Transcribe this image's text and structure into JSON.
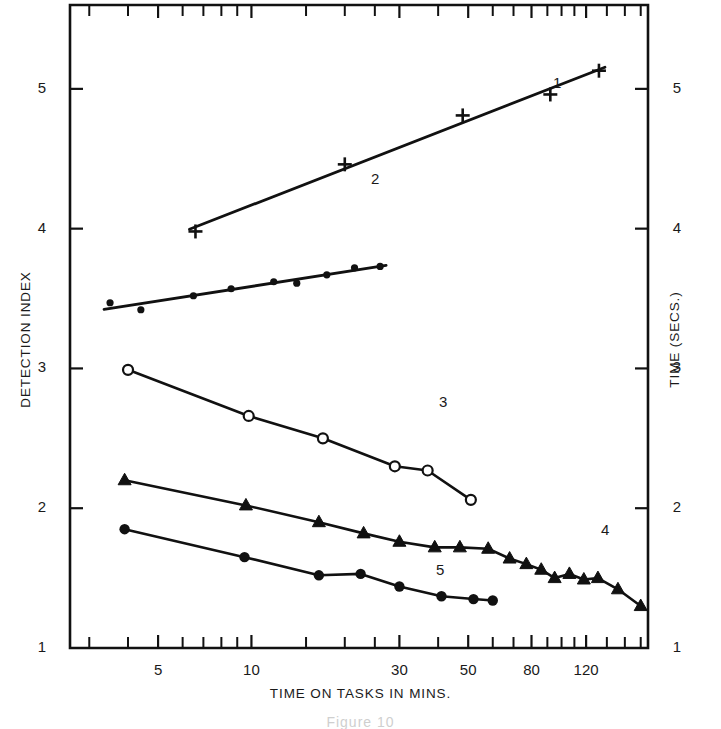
{
  "figure": {
    "caption": "Figure 10",
    "background": "#ffffff",
    "ink_color": "#111111"
  },
  "axes": {
    "x": {
      "title": "TIME ON TASKS IN MINS.",
      "scale": "log",
      "range": [
        2.6,
        190
      ],
      "labeled_ticks": [
        "5",
        "10",
        "30",
        "50",
        "80",
        "120"
      ],
      "labeled_tick_values": [
        5,
        10,
        30,
        50,
        80,
        120
      ],
      "minor_tick_values": [
        3,
        4,
        6,
        7,
        8,
        9,
        15,
        20,
        25,
        40,
        60,
        70,
        90,
        100,
        110,
        140,
        160,
        180
      ]
    },
    "y_left": {
      "title": "DETECTION INDEX",
      "scale": "linear",
      "range": [
        1,
        5.6
      ],
      "labeled_ticks": [
        "1",
        "2",
        "3",
        "4",
        "5"
      ],
      "labeled_tick_values": [
        1,
        2,
        3,
        4,
        5
      ]
    },
    "y_right": {
      "title": "TIME (SECS.)",
      "scale": "linear",
      "range": [
        1,
        5.6
      ],
      "labeled_ticks": [
        "1",
        "2",
        "3",
        "4",
        "5"
      ],
      "labeled_tick_values": [
        1,
        2,
        3,
        4,
        5
      ]
    }
  },
  "chart_data": {
    "type": "line",
    "title": "",
    "subtitle": "",
    "xlabel": "TIME ON TASKS IN MINS.",
    "ylabel": "DETECTION INDEX",
    "y2label": "TIME (SECS.)",
    "xscale": "log",
    "xlim": [
      2.6,
      190
    ],
    "ylim": [
      1,
      5.6
    ],
    "grid": false,
    "legend": "inline-end-labels",
    "series": [
      {
        "name": "1",
        "label": "1",
        "marker": "plus",
        "fit": "straight-line",
        "points": [
          {
            "x": 6.6,
            "y": 3.98
          },
          {
            "x": 20.0,
            "y": 4.46
          },
          {
            "x": 48.0,
            "y": 4.81
          },
          {
            "x": 92.0,
            "y": 4.96
          },
          {
            "x": 132.0,
            "y": 5.13
          }
        ]
      },
      {
        "name": "2",
        "label": "2",
        "marker": "dot-small",
        "fit": "straight-line",
        "points": [
          {
            "x": 3.5,
            "y": 3.47
          },
          {
            "x": 4.4,
            "y": 3.42
          },
          {
            "x": 6.5,
            "y": 3.52
          },
          {
            "x": 8.6,
            "y": 3.57
          },
          {
            "x": 11.8,
            "y": 3.62
          },
          {
            "x": 14.0,
            "y": 3.61
          },
          {
            "x": 17.5,
            "y": 3.67
          },
          {
            "x": 21.5,
            "y": 3.72
          },
          {
            "x": 26.0,
            "y": 3.73
          }
        ]
      },
      {
        "name": "3",
        "label": "3",
        "marker": "open-circle",
        "fit": "connected",
        "points": [
          {
            "x": 4.0,
            "y": 2.99
          },
          {
            "x": 9.8,
            "y": 2.66
          },
          {
            "x": 17.0,
            "y": 2.5
          },
          {
            "x": 29.0,
            "y": 2.3
          },
          {
            "x": 37.0,
            "y": 2.27
          },
          {
            "x": 51.0,
            "y": 2.06
          }
        ]
      },
      {
        "name": "4",
        "label": "4",
        "marker": "triangle",
        "fit": "connected",
        "points": [
          {
            "x": 3.9,
            "y": 2.2
          },
          {
            "x": 9.6,
            "y": 2.02
          },
          {
            "x": 16.5,
            "y": 1.9
          },
          {
            "x": 23.0,
            "y": 1.82
          },
          {
            "x": 30.0,
            "y": 1.76
          },
          {
            "x": 39.0,
            "y": 1.72
          },
          {
            "x": 47.0,
            "y": 1.72
          },
          {
            "x": 58.0,
            "y": 1.71
          },
          {
            "x": 68.0,
            "y": 1.64
          },
          {
            "x": 77.0,
            "y": 1.6
          },
          {
            "x": 86.0,
            "y": 1.56
          },
          {
            "x": 95.0,
            "y": 1.5
          },
          {
            "x": 106.0,
            "y": 1.53
          },
          {
            "x": 118.0,
            "y": 1.49
          },
          {
            "x": 131.0,
            "y": 1.5
          },
          {
            "x": 152.0,
            "y": 1.42
          },
          {
            "x": 180.0,
            "y": 1.3
          }
        ]
      },
      {
        "name": "5",
        "label": "5",
        "marker": "dot-filled",
        "fit": "connected",
        "points": [
          {
            "x": 3.9,
            "y": 1.85
          },
          {
            "x": 9.5,
            "y": 1.65
          },
          {
            "x": 16.5,
            "y": 1.52
          },
          {
            "x": 22.5,
            "y": 1.53
          },
          {
            "x": 30.0,
            "y": 1.44
          },
          {
            "x": 41.0,
            "y": 1.37
          },
          {
            "x": 52.0,
            "y": 1.35
          },
          {
            "x": 60.0,
            "y": 1.34
          }
        ]
      }
    ]
  },
  "series_labels": [
    {
      "text": "1",
      "x": 553,
      "y": 74
    },
    {
      "text": "2",
      "x": 371,
      "y": 170
    },
    {
      "text": "3",
      "x": 439,
      "y": 393
    },
    {
      "text": "4",
      "x": 601,
      "y": 521
    },
    {
      "text": "5",
      "x": 436,
      "y": 561
    }
  ]
}
